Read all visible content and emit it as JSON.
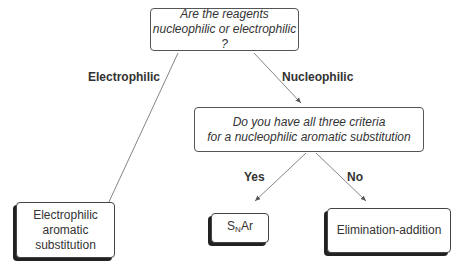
{
  "nodes": {
    "q1": {
      "line1": "Are the reagents",
      "line2": "nucleophilic or electrophilic ?"
    },
    "q2": {
      "line1": "Do you have all three criteria",
      "line2": "for a nucleophilic aromatic substitution"
    },
    "electrophilic": {
      "line1": "Electrophilic",
      "line2": "aromatic",
      "line3": "substitution"
    },
    "snar": {
      "s": "S",
      "sub": "N",
      "rest": "Ar"
    },
    "elim": {
      "label": "Elimination-addition"
    }
  },
  "edges": {
    "electrophilic": "Electrophilic",
    "nucleophilic": "Nucleophilic",
    "yes": "Yes",
    "no": "No"
  }
}
